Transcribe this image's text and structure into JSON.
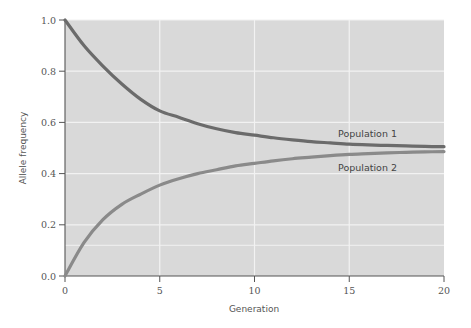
{
  "chart_data": {
    "type": "line",
    "title": "",
    "xlabel": "Generation",
    "ylabel": "Allele frequency",
    "xlim": [
      0,
      20
    ],
    "ylim": [
      0.0,
      1.0
    ],
    "xticks": [
      0,
      5,
      10,
      15,
      20
    ],
    "xtick_labels": [
      "0",
      "5",
      "10",
      "15",
      "20"
    ],
    "yticks": [
      0.0,
      0.2,
      0.4,
      0.6,
      0.8,
      1.0
    ],
    "ytick_labels": [
      "0.0",
      "0.2",
      "0.4",
      "0.6",
      "0.8",
      "1.0"
    ],
    "grid": true,
    "extra_gridline_y": 0.12,
    "legend": "inline labels",
    "x": [
      0,
      1,
      2,
      3,
      4,
      5,
      6,
      7,
      8,
      9,
      10,
      11,
      12,
      13,
      14,
      15,
      16,
      17,
      18,
      19,
      20
    ],
    "series": [
      {
        "name": "Population 1",
        "color": "#6b6b6b",
        "values": [
          1.0,
          0.9,
          0.82,
          0.75,
          0.69,
          0.645,
          0.62,
          0.595,
          0.575,
          0.56,
          0.55,
          0.54,
          0.532,
          0.525,
          0.52,
          0.515,
          0.512,
          0.51,
          0.508,
          0.506,
          0.505
        ]
      },
      {
        "name": "Population 2",
        "color": "#8a8a8a",
        "values": [
          0.0,
          0.13,
          0.22,
          0.28,
          0.32,
          0.355,
          0.38,
          0.4,
          0.415,
          0.43,
          0.44,
          0.45,
          0.458,
          0.464,
          0.47,
          0.475,
          0.478,
          0.481,
          0.483,
          0.485,
          0.486
        ]
      }
    ],
    "plot_background": "#d9d9d9",
    "gridline_color": "#f2f2f2"
  }
}
